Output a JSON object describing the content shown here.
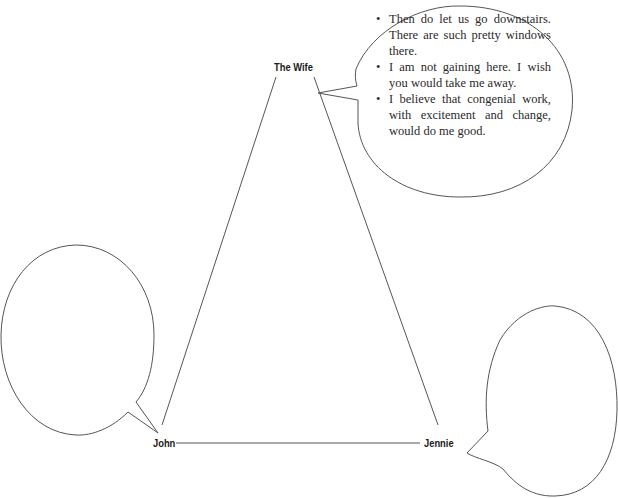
{
  "diagram": {
    "type": "character-triangle",
    "nodes": {
      "top": {
        "label": "The Wife"
      },
      "bottom_left": {
        "label": "John"
      },
      "bottom_right": {
        "label": "Jennie"
      }
    },
    "bubbles": {
      "wife": {
        "bullet_glyph": "•",
        "items": [
          "Then do let us go downstairs. There are such pretty windows there.",
          "I am not gaining here. I wish you would take me away.",
          "I believe that congenial work, with excitement and change, would do me good."
        ]
      },
      "john": {
        "items": []
      },
      "jennie": {
        "items": []
      }
    },
    "colors": {
      "line": "#555555",
      "text": "#2a2a2a",
      "background": "#ffffff"
    }
  }
}
